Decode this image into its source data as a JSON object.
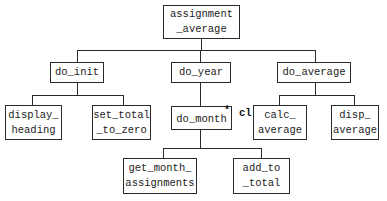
{
  "diagram": {
    "type": "structure-chart",
    "nodes": {
      "root": {
        "label": "assignment\n_average"
      },
      "do_init": {
        "label": "do_init"
      },
      "do_year": {
        "label": "do_year"
      },
      "do_average": {
        "label": "do_average"
      },
      "display_heading": {
        "label": "display_\nheading"
      },
      "set_total_to_zero": {
        "label": "set_total\n_to_zero"
      },
      "do_month": {
        "label": "do_month"
      },
      "calc_average": {
        "label": "calc_\naverage"
      },
      "disp_average": {
        "label": "disp_\naverage"
      },
      "get_month_assignments": {
        "label": "get_month_\nassignments"
      },
      "add_to_total": {
        "label": "add_to\n_total"
      }
    },
    "annotations": {
      "loop_marker": "*",
      "do_month_note": "cl"
    },
    "edges": [
      [
        "root",
        "do_init"
      ],
      [
        "root",
        "do_year"
      ],
      [
        "root",
        "do_average"
      ],
      [
        "do_init",
        "display_heading"
      ],
      [
        "do_init",
        "set_total_to_zero"
      ],
      [
        "do_year",
        "do_month"
      ],
      [
        "do_average",
        "calc_average"
      ],
      [
        "do_average",
        "disp_average"
      ],
      [
        "do_month",
        "get_month_assignments"
      ],
      [
        "do_month",
        "add_to_total"
      ]
    ]
  }
}
